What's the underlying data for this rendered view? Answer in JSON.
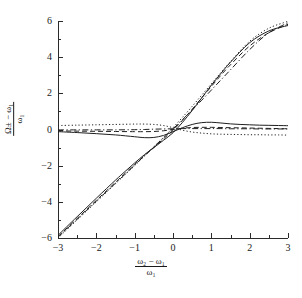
{
  "chart_data": {
    "type": "line",
    "title": "",
    "xlabel": "(ω₂ − ω₁)/ω₁",
    "ylabel": "(Ω± − ω₁)/ω₁",
    "xlim": [
      -3,
      3
    ],
    "ylim": [
      -6,
      6
    ],
    "grid": false,
    "legend": "none",
    "xticks": [
      -3,
      -2,
      -1,
      0,
      1,
      2,
      3
    ],
    "yticks": [
      -6,
      -4,
      -2,
      0,
      2,
      4,
      6
    ],
    "xtick_labels": [
      "−3",
      "−2",
      "−1",
      "0",
      "1",
      "2",
      "3"
    ],
    "ytick_labels": [
      "−6",
      "−4",
      "−2",
      "0",
      "2",
      "4",
      "6"
    ],
    "x_minor_ticks": [
      -2.5,
      -1.5,
      -0.5,
      0.5,
      1.5,
      2.5
    ],
    "y_minor_ticks": [
      -5,
      -3,
      -1,
      1,
      3,
      5
    ],
    "series": [
      {
        "name": "upper-branch-solid",
        "style": "solid",
        "x": [
          -3.0,
          -2.5,
          -2.0,
          -1.5,
          -1.0,
          -0.75,
          -0.5,
          -0.25,
          0.0,
          0.25,
          0.5,
          0.75,
          1.0,
          1.25,
          1.5,
          1.75,
          2.0,
          2.25,
          2.5,
          2.75,
          3.0
        ],
        "values": [
          -0.12,
          -0.17,
          -0.23,
          -0.3,
          -0.4,
          -0.45,
          -0.44,
          -0.33,
          -0.12,
          0.1,
          0.28,
          0.38,
          0.4,
          0.36,
          0.31,
          0.28,
          0.26,
          0.24,
          0.23,
          0.22,
          0.21
        ]
      },
      {
        "name": "upper-branch-dashed",
        "style": "dashed",
        "x": [
          -3.0,
          -2.5,
          -2.0,
          -1.5,
          -1.0,
          -0.75,
          -0.5,
          -0.25,
          0.0,
          0.25,
          0.5,
          0.75,
          1.0,
          1.25,
          1.5,
          1.75,
          2.0,
          2.25,
          2.5,
          2.75,
          3.0
        ],
        "values": [
          -0.08,
          -0.09,
          -0.1,
          -0.11,
          -0.12,
          -0.12,
          -0.11,
          -0.07,
          0.0,
          0.07,
          0.11,
          0.12,
          0.12,
          0.11,
          0.1,
          0.09,
          0.08,
          0.07,
          0.06,
          0.05,
          0.04
        ]
      },
      {
        "name": "upper-branch-dashdot",
        "style": "dashdot",
        "x": [
          -3.0,
          -2.5,
          -2.0,
          -1.5,
          -1.0,
          -0.75,
          -0.5,
          -0.25,
          0.0,
          0.25,
          0.5,
          0.75,
          1.0,
          1.25,
          1.5,
          1.75,
          2.0,
          2.25,
          2.5,
          2.75,
          3.0
        ],
        "values": [
          -0.02,
          -0.02,
          -0.02,
          -0.02,
          -0.01,
          0.0,
          0.02,
          0.03,
          0.04,
          0.05,
          0.05,
          0.05,
          0.05,
          0.05,
          0.04,
          0.04,
          0.04,
          0.03,
          0.03,
          0.03,
          0.03
        ]
      },
      {
        "name": "upper-branch-dotted",
        "style": "dotted",
        "x": [
          -3.0,
          -2.5,
          -2.0,
          -1.5,
          -1.0,
          -0.75,
          -0.5,
          -0.25,
          0.0,
          0.25,
          0.5,
          0.75,
          1.0,
          1.25,
          1.5,
          1.75,
          2.0,
          2.25,
          2.5,
          2.75,
          3.0
        ],
        "values": [
          0.22,
          0.24,
          0.26,
          0.28,
          0.3,
          0.3,
          0.28,
          0.22,
          0.1,
          -0.04,
          -0.14,
          -0.2,
          -0.24,
          -0.26,
          -0.27,
          -0.28,
          -0.29,
          -0.29,
          -0.3,
          -0.3,
          -0.31
        ]
      },
      {
        "name": "diverging-solid",
        "style": "solid",
        "x": [
          -3.0,
          -2.5,
          -2.0,
          -1.5,
          -1.25,
          -1.0,
          -0.75,
          -0.5,
          -0.25,
          0.0,
          0.25,
          0.5,
          0.75,
          1.0,
          1.25,
          1.5,
          2.0,
          2.5,
          3.0
        ],
        "values": [
          -5.85,
          -4.82,
          -3.8,
          -2.8,
          -2.32,
          -1.85,
          -1.4,
          -1.0,
          -0.6,
          -0.18,
          0.4,
          1.05,
          1.75,
          2.45,
          3.1,
          3.72,
          4.8,
          5.45,
          5.75
        ]
      },
      {
        "name": "diverging-dashed",
        "style": "dashed",
        "x": [
          -3.0,
          -2.5,
          -2.0,
          -1.5,
          -1.25,
          -1.0,
          -0.75,
          -0.5,
          -0.25,
          0.0,
          0.25,
          0.5,
          0.75,
          1.0,
          1.25,
          1.5,
          2.0,
          2.5,
          3.0
        ],
        "values": [
          -5.92,
          -4.92,
          -3.92,
          -2.92,
          -2.42,
          -1.93,
          -1.45,
          -1.0,
          -0.52,
          -0.05,
          0.52,
          1.12,
          1.75,
          2.38,
          3.0,
          3.58,
          4.62,
          5.35,
          5.82
        ]
      },
      {
        "name": "diverging-dashdot",
        "style": "dashdot",
        "x": [
          -3.0,
          -2.5,
          -2.0,
          -1.5,
          -1.25,
          -1.0,
          -0.75,
          -0.5,
          -0.25,
          0.0,
          0.25,
          0.5,
          0.75,
          1.0,
          1.25,
          1.5,
          2.0,
          2.5,
          3.0
        ],
        "values": [
          -5.95,
          -4.96,
          -3.96,
          -2.97,
          -2.47,
          -1.97,
          -1.46,
          -0.96,
          -0.46,
          0.03,
          0.55,
          1.08,
          1.62,
          2.18,
          2.74,
          3.3,
          4.42,
          5.35,
          5.9
        ]
      },
      {
        "name": "diverging-dotted",
        "style": "dotted",
        "x": [
          -3.0,
          -2.5,
          -2.0,
          -1.5,
          -1.25,
          -1.0,
          -0.75,
          -0.5,
          -0.25,
          0.0,
          0.25,
          0.5,
          0.75,
          1.0,
          1.25,
          1.5,
          2.0,
          2.5,
          3.0
        ],
        "values": [
          -6.0,
          -5.0,
          -4.0,
          -3.0,
          -2.5,
          -2.0,
          -1.48,
          -0.96,
          -0.44,
          0.1,
          0.68,
          1.28,
          1.9,
          2.52,
          3.15,
          3.76,
          4.88,
          5.6,
          5.98
        ]
      }
    ],
    "x_axis": {
      "label_numerator": "ω₂ − ω₁",
      "label_denominator": "ω₁"
    },
    "y_axis": {
      "label_numerator": "Ω± − ω₁",
      "label_denominator": "ω₁"
    }
  },
  "colors": {
    "axis": "#2b2b2b",
    "curve": "#1f1f1f",
    "background": "#ffffff"
  }
}
